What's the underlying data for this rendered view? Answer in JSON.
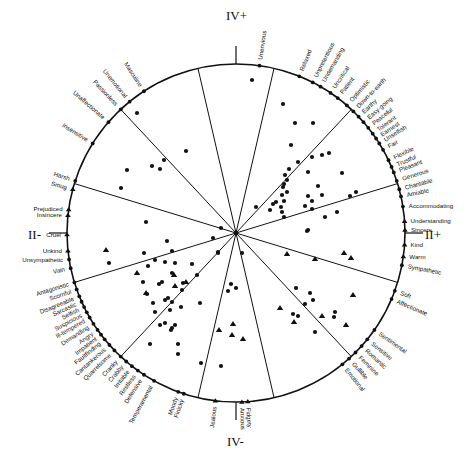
{
  "diagram": {
    "type": "circumplex",
    "center": [
      236,
      233
    ],
    "radius": 169,
    "line_color": "#111111",
    "background": "#ffffff",
    "axis_labels": {
      "top": "IV+",
      "bottom": "IV-",
      "left": "II-",
      "right": "II+"
    },
    "spoke_angles_deg": [
      77,
      47,
      17,
      -17,
      -47,
      -77,
      -103,
      -133,
      -163,
      163,
      133,
      103
    ],
    "rim_labels": [
      {
        "text": "Unenvious",
        "angle": 82,
        "marker": "dot"
      },
      {
        "text": "Relaxed",
        "angle": 68,
        "marker": "dot"
      },
      {
        "text": "Unpretentious",
        "angle": 63,
        "marker": "dot"
      },
      {
        "text": "Undemanding",
        "angle": 60,
        "marker": "dot"
      },
      {
        "text": "Uncritical",
        "angle": 56,
        "marker": "dot"
      },
      {
        "text": "Patient",
        "angle": 53,
        "marker": "dot"
      },
      {
        "text": "Optimistic",
        "angle": 49,
        "marker": "dot"
      },
      {
        "text": "Down-to-earth",
        "angle": 46,
        "marker": "dot"
      },
      {
        "text": "Earthy",
        "angle": 43.5,
        "marker": "dot"
      },
      {
        "text": "Easy-going",
        "angle": 41,
        "marker": "dot"
      },
      {
        "text": "Peaceful",
        "angle": 38.5,
        "marker": "dot"
      },
      {
        "text": "Tolerant",
        "angle": 36,
        "marker": "dot"
      },
      {
        "text": "Earnest",
        "angle": 34,
        "marker": "dot"
      },
      {
        "text": "Unselfish",
        "angle": 32,
        "marker": "dot"
      },
      {
        "text": "Fair",
        "angle": 29.5,
        "marker": "dot"
      },
      {
        "text": "Flexible",
        "angle": 25.5,
        "marker": "dot"
      },
      {
        "text": "Trustful",
        "angle": 23,
        "marker": "dot"
      },
      {
        "text": "Pleasant",
        "angle": 21,
        "marker": "dot"
      },
      {
        "text": "Generous",
        "angle": 18,
        "marker": "dot"
      },
      {
        "text": "Charitable",
        "angle": 15,
        "marker": "dot"
      },
      {
        "text": "Amiable",
        "angle": 12.5,
        "marker": "dot"
      },
      {
        "text": "Accommodating",
        "angle": 9,
        "marker": "dot"
      },
      {
        "text": "Understanding",
        "angle": 4,
        "marker": "triangle"
      },
      {
        "text": "Sincere",
        "angle": 1,
        "marker": "triangle"
      },
      {
        "text": "Kind",
        "angle": -4,
        "marker": "triangle"
      },
      {
        "text": "Warm",
        "angle": -8,
        "marker": "triangle"
      },
      {
        "text": "Sympathetic",
        "angle": -11,
        "marker": "dot"
      },
      {
        "text": "Soft",
        "angle": -20,
        "marker": "dot"
      },
      {
        "text": "Affectionate",
        "angle": -23,
        "marker": "dot"
      },
      {
        "text": "Sentimental",
        "angle": -35,
        "marker": "dot"
      },
      {
        "text": "Sensitive",
        "angle": -39,
        "marker": "dot"
      },
      {
        "text": "Romantic",
        "angle": -42,
        "marker": "dot"
      },
      {
        "text": "Feminine",
        "angle": -45,
        "marker": "dot"
      },
      {
        "text": "Gullible",
        "angle": -48,
        "marker": "dot"
      },
      {
        "text": "Emotional",
        "angle": -51,
        "marker": "dot"
      },
      {
        "text": "Fidgety",
        "angle": -86,
        "marker": "triangle"
      },
      {
        "text": "Anxious",
        "angle": -88,
        "marker": "triangle"
      },
      {
        "text": "Jealous",
        "angle": -97,
        "marker": "triangle"
      },
      {
        "text": "Finicky",
        "angle": -108,
        "marker": "dot"
      },
      {
        "text": "Moody",
        "angle": -110,
        "marker": "dot"
      },
      {
        "text": "Temperamental",
        "angle": -119,
        "marker": "dot"
      },
      {
        "text": "Defensive",
        "angle": -123,
        "marker": "dot"
      },
      {
        "text": "Restless",
        "angle": -125.5,
        "marker": "dot"
      },
      {
        "text": "Irritable",
        "angle": -128,
        "marker": "dot"
      },
      {
        "text": "Crabby",
        "angle": -130.5,
        "marker": "dot"
      },
      {
        "text": "Cranky",
        "angle": -133,
        "marker": "dot"
      },
      {
        "text": "Quarrelsome",
        "angle": -136,
        "marker": "dot"
      },
      {
        "text": "Cantankerous",
        "angle": -138.5,
        "marker": "dot"
      },
      {
        "text": "Faultfinding",
        "angle": -141,
        "marker": "dot"
      },
      {
        "text": "Impatient",
        "angle": -143,
        "marker": "dot"
      },
      {
        "text": "Angry",
        "angle": -145,
        "marker": "dot"
      },
      {
        "text": "Demanding",
        "angle": -147.5,
        "marker": "dot"
      },
      {
        "text": "Ill-tempered",
        "angle": -150,
        "marker": "dot"
      },
      {
        "text": "Suspicious",
        "angle": -152,
        "marker": "dot"
      },
      {
        "text": "Selfish",
        "angle": -154,
        "marker": "dot"
      },
      {
        "text": "Sarcastic",
        "angle": -156,
        "marker": "dot"
      },
      {
        "text": "Disagreeable",
        "angle": -158,
        "marker": "dot"
      },
      {
        "text": "Scornful",
        "angle": -160.5,
        "marker": "dot"
      },
      {
        "text": "Antagonistic",
        "angle": -163,
        "marker": "dot"
      },
      {
        "text": "Vain",
        "angle": -168,
        "marker": "dot"
      },
      {
        "text": "Harsh",
        "angle": 162,
        "marker": "dot"
      },
      {
        "text": "Smug",
        "angle": 165,
        "marker": "triangle"
      },
      {
        "text": "Prejudiced",
        "angle": 172,
        "marker": "triangle"
      },
      {
        "text": "Insincere",
        "angle": 174,
        "marker": "triangle"
      },
      {
        "text": "Cruel",
        "angle": 180.5,
        "marker": "triangle"
      },
      {
        "text": "Unkind",
        "angle": 186,
        "marker": "triangle"
      },
      {
        "text": "Unsympathetic",
        "angle": 189,
        "marker": "dot"
      },
      {
        "text": "Insensitive",
        "angle": 148,
        "marker": "dot"
      },
      {
        "text": "Unaffectionate",
        "angle": 139,
        "marker": "dot"
      },
      {
        "text": "Passionless",
        "angle": 133,
        "marker": "dot"
      },
      {
        "text": "Unemotional",
        "angle": 129,
        "marker": "dot"
      },
      {
        "text": "Masculine",
        "angle": 123,
        "marker": "dot"
      }
    ],
    "interior_points": {
      "dots": [
        [
          137,
          113
        ],
        [
          186,
          151
        ],
        [
          160,
          169
        ],
        [
          127,
          170
        ],
        [
          152,
          166
        ],
        [
          164,
          160
        ],
        [
          121,
          188
        ],
        [
          252,
          80
        ],
        [
          283,
          104
        ],
        [
          295,
          123
        ],
        [
          313,
          123
        ],
        [
          291,
          145
        ],
        [
          298,
          162
        ],
        [
          312,
          157
        ],
        [
          322,
          155
        ],
        [
          329,
          153
        ],
        [
          289,
          169
        ],
        [
          285,
          175
        ],
        [
          287,
          180
        ],
        [
          284,
          184
        ],
        [
          283,
          187
        ],
        [
          287,
          192
        ],
        [
          282,
          195
        ],
        [
          284,
          201
        ],
        [
          276,
          202
        ],
        [
          281,
          207
        ],
        [
          273,
          204
        ],
        [
          270,
          210
        ],
        [
          282,
          212
        ],
        [
          284,
          217
        ],
        [
          308,
          172
        ],
        [
          318,
          186
        ],
        [
          308,
          196
        ],
        [
          322,
          195
        ],
        [
          305,
          206
        ],
        [
          312,
          201
        ],
        [
          312,
          209
        ],
        [
          337,
          212
        ],
        [
          325,
          217
        ],
        [
          350,
          196
        ],
        [
          356,
          192
        ],
        [
          342,
          173
        ],
        [
          256,
          207
        ],
        [
          308,
          230
        ],
        [
          307,
          231
        ],
        [
          221,
          228
        ],
        [
          213,
          238
        ],
        [
          146,
          222
        ],
        [
          109,
          263
        ],
        [
          144,
          253
        ],
        [
          172,
          251
        ],
        [
          167,
          241
        ],
        [
          155,
          260
        ],
        [
          148,
          266
        ],
        [
          165,
          262
        ],
        [
          172,
          273
        ],
        [
          143,
          282
        ],
        [
          159,
          284
        ],
        [
          147,
          294
        ],
        [
          153,
          303
        ],
        [
          162,
          282
        ],
        [
          168,
          298
        ],
        [
          165,
          300
        ],
        [
          182,
          290
        ],
        [
          192,
          264
        ],
        [
          183,
          283
        ],
        [
          172,
          302
        ],
        [
          170,
          310
        ],
        [
          175,
          263
        ],
        [
          155,
          312
        ],
        [
          165,
          323
        ],
        [
          150,
          344
        ],
        [
          178,
          344
        ],
        [
          172,
          328
        ],
        [
          175,
          325
        ],
        [
          181,
          307
        ],
        [
          160,
          325
        ],
        [
          171,
          330
        ],
        [
          197,
          275
        ],
        [
          200,
          303
        ],
        [
          218,
          252
        ],
        [
          178,
          354
        ],
        [
          201,
          363
        ],
        [
          221,
          366
        ],
        [
          218,
          253
        ],
        [
          231,
          284
        ],
        [
          236,
          288
        ],
        [
          310,
          293
        ],
        [
          296,
          288
        ],
        [
          305,
          304
        ],
        [
          313,
          300
        ],
        [
          334,
          317
        ],
        [
          315,
          332
        ],
        [
          228,
          291
        ],
        [
          242,
          253
        ],
        [
          293,
          314
        ],
        [
          298,
          316
        ],
        [
          335,
          312
        ]
      ],
      "triangles": [
        [
          106,
          250
        ],
        [
          137,
          273
        ],
        [
          146,
          293
        ],
        [
          175,
          286
        ],
        [
          174,
          275
        ],
        [
          186,
          282
        ],
        [
          287,
          254
        ],
        [
          315,
          259
        ],
        [
          344,
          253
        ],
        [
          351,
          258
        ],
        [
          353,
          295
        ],
        [
          346,
          325
        ],
        [
          322,
          316
        ],
        [
          294,
          322
        ],
        [
          280,
          308
        ],
        [
          232,
          335
        ],
        [
          233,
          324
        ],
        [
          219,
          330
        ],
        [
          243,
          339
        ]
      ]
    }
  }
}
